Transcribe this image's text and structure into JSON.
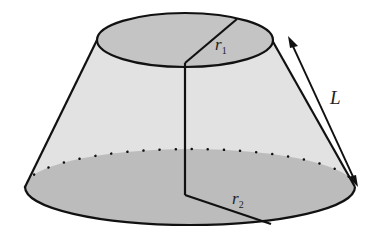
{
  "diagram": {
    "type": "truncated-cone (frustum)",
    "labels": {
      "top_radius": "r",
      "top_radius_sub": "1",
      "bottom_radius": "r",
      "bottom_radius_sub": "2",
      "slant_height": "L"
    },
    "colors": {
      "lateral_surface": "#e2e2e2",
      "base_fill": "#bcbcbc",
      "top_fill": "#c4c4c4",
      "stroke": "#111111"
    }
  }
}
